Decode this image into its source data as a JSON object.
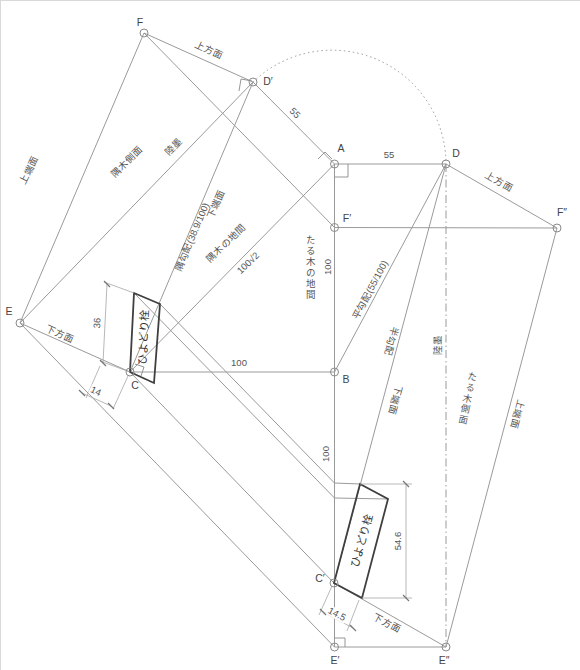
{
  "diagram": {
    "colors": {
      "line": "#9a9a9a",
      "bold_outline": "#3f3f3f",
      "text": "#555555"
    },
    "points": {
      "F": "F",
      "D2": "D′",
      "A": "A",
      "D": "D",
      "F2": "F′",
      "F3": "F″",
      "E": "E",
      "C": "C",
      "B": "B",
      "C2": "C′",
      "E2": "E′",
      "E3": "E″"
    },
    "dims": {
      "hip_55": "55",
      "top_55": "55",
      "rafter_span_100": "100",
      "plan_100": "100",
      "lower_100": "100",
      "hip_span_root2": "100√2",
      "pin_36": "36",
      "pin_14": "14",
      "pin_546": "54.6",
      "pin_145": "14.5"
    },
    "labels": {
      "joho_left": "上方面",
      "joho_right": "上方面",
      "jotan_left": "上端面",
      "jotan_right": "上端面",
      "kaho_left": "下方面",
      "kaho_right": "下方面",
      "katan_left": "下端面",
      "katan_right": "下端面",
      "sumiki_sokumen": "隅木側面",
      "taruki_sokumen": "たる木側面",
      "sumi_kobai": "隅勾配(38.9/100)",
      "hira_kobai": "平勾配(55/100)",
      "han_kobai": "半勾配",
      "rokuzumi_left": "陸墨",
      "rokuzumi_right": "陸墨",
      "taruki_no_jima": "たる木の地間",
      "sumiki_no_jima": "隅木の地間",
      "hiyodori_left": "ひよどり栓",
      "hiyodori_right": "ひよどり栓"
    }
  }
}
